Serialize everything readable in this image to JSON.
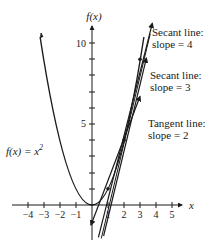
{
  "diagram": {
    "axes": {
      "x_label": "x",
      "y_label": "f(x)",
      "x_ticks": [
        "−4",
        "−3",
        "−2",
        "−1",
        "1",
        "2",
        "3",
        "4",
        "5"
      ],
      "y_ticks": [
        "5",
        "10"
      ]
    },
    "curve": {
      "label_prefix": "f(x) = x",
      "label_exp": "2",
      "function": "x^2"
    },
    "lines": [
      {
        "name": "secant-slope-4",
        "label_line1": "Secant line:",
        "label_line2": "slope = 4",
        "slope": 4,
        "through": [
          [
            1,
            1
          ],
          [
            3,
            9
          ]
        ]
      },
      {
        "name": "secant-slope-3",
        "label_line1": "Secant line:",
        "label_line2": "slope = 3",
        "slope": 3,
        "through": [
          [
            1,
            1
          ],
          [
            2,
            4
          ]
        ]
      },
      {
        "name": "tangent-slope-2",
        "label_line1": "Tangent line:",
        "label_line2": "slope = 2",
        "slope": 2,
        "through": [
          [
            1,
            1
          ]
        ]
      }
    ],
    "points": [
      [
        1,
        1
      ],
      [
        2,
        4
      ],
      [
        3,
        9
      ]
    ],
    "colors": {
      "ink": "#1a1a1a",
      "background": "#ffffff"
    }
  }
}
